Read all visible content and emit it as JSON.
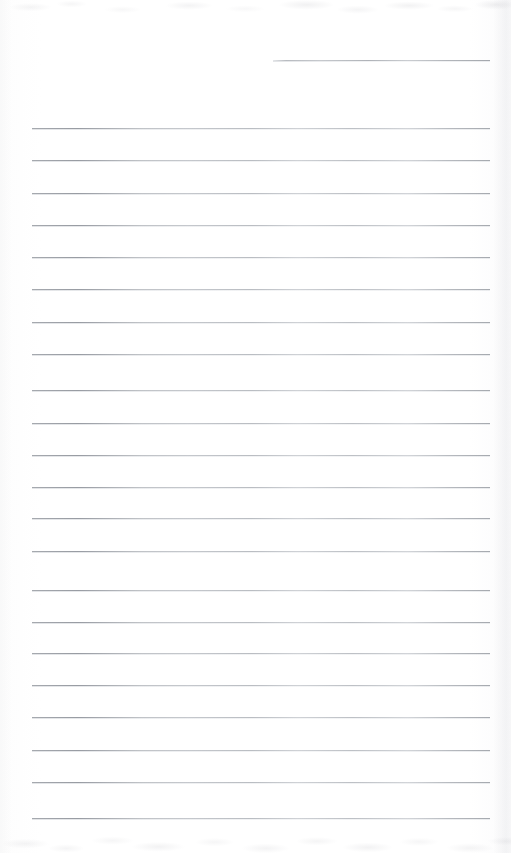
{
  "document": {
    "kind": "scanned-lined-notebook-page",
    "title": "Blank Ruled Notebook Page",
    "description": "A scanned blank sheet of ruled (lined) notebook paper with no handwriting or printed text.",
    "text_content": "",
    "page_number": "",
    "width_px": 511,
    "height_px": 853
  },
  "colors": {
    "paper": "#ffffff",
    "paper_tint": "#fdfdfd",
    "rule_line": "#9ea2a8",
    "rule_line_light": "#bcc0c6",
    "edge_shadow": "#a8aab0"
  },
  "layout": {
    "rule_left_x": 32,
    "rule_right_x": 490,
    "rule_spacing_px": 32.2,
    "first_full_rule_y": 128,
    "last_full_rule_y": 818,
    "full_rule_count": 22
  },
  "partial_rule": {
    "label": "short top rule",
    "y": 60,
    "x_start": 273,
    "x_end": 490
  },
  "rules": [
    {
      "index": 1,
      "y": 128
    },
    {
      "index": 2,
      "y": 160
    },
    {
      "index": 3,
      "y": 193
    },
    {
      "index": 4,
      "y": 225
    },
    {
      "index": 5,
      "y": 257
    },
    {
      "index": 6,
      "y": 289
    },
    {
      "index": 7,
      "y": 322
    },
    {
      "index": 8,
      "y": 354
    },
    {
      "index": 9,
      "y": 390
    },
    {
      "index": 10,
      "y": 423
    },
    {
      "index": 11,
      "y": 455
    },
    {
      "index": 12,
      "y": 487
    },
    {
      "index": 13,
      "y": 518
    },
    {
      "index": 14,
      "y": 551
    },
    {
      "index": 15,
      "y": 590
    },
    {
      "index": 16,
      "y": 622
    },
    {
      "index": 17,
      "y": 653
    },
    {
      "index": 18,
      "y": 685
    },
    {
      "index": 19,
      "y": 717
    },
    {
      "index": 20,
      "y": 750
    },
    {
      "index": 21,
      "y": 782
    },
    {
      "index": 22,
      "y": 818
    }
  ]
}
